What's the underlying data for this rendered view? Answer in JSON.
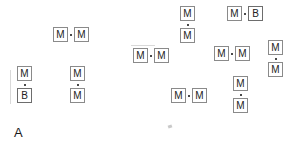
{
  "panel": {
    "label": "A",
    "label_x": 14,
    "label_y": 126
  },
  "canvas": {
    "width": 299,
    "height": 146,
    "background": "#ffffff"
  },
  "style": {
    "box_border_color": "#8a8a8a",
    "box_fill": "#ffffff",
    "text_color": "#222222",
    "bond_color": "#4a4a4a",
    "box_size": 15
  },
  "units": [
    {
      "id": "u1",
      "label": "M",
      "x": 53,
      "y": 27
    },
    {
      "id": "u2",
      "label": "M",
      "x": 74,
      "y": 27
    },
    {
      "id": "u3",
      "label": "M",
      "x": 17,
      "y": 66
    },
    {
      "id": "u4",
      "label": "B",
      "x": 17,
      "y": 88
    },
    {
      "id": "u5",
      "label": "M",
      "x": 70,
      "y": 66
    },
    {
      "id": "u6",
      "label": "M",
      "x": 70,
      "y": 88
    },
    {
      "id": "u7",
      "label": "M",
      "x": 180,
      "y": 6
    },
    {
      "id": "u8",
      "label": "M",
      "x": 180,
      "y": 28
    },
    {
      "id": "u9",
      "label": "M",
      "x": 227,
      "y": 6
    },
    {
      "id": "u10",
      "label": "B",
      "x": 248,
      "y": 6
    },
    {
      "id": "u11",
      "label": "M",
      "x": 133,
      "y": 48
    },
    {
      "id": "u12",
      "label": "M",
      "x": 154,
      "y": 48
    },
    {
      "id": "u13",
      "label": "M",
      "x": 214,
      "y": 46
    },
    {
      "id": "u14",
      "label": "M",
      "x": 235,
      "y": 46
    },
    {
      "id": "u15",
      "label": "M",
      "x": 268,
      "y": 40
    },
    {
      "id": "u16",
      "label": "M",
      "x": 268,
      "y": 62
    },
    {
      "id": "u17",
      "label": "M",
      "x": 171,
      "y": 88
    },
    {
      "id": "u18",
      "label": "M",
      "x": 192,
      "y": 88
    },
    {
      "id": "u19",
      "label": "M",
      "x": 233,
      "y": 76
    },
    {
      "id": "u20",
      "label": "M",
      "x": 233,
      "y": 98
    }
  ],
  "bonds": [
    {
      "id": "b1",
      "orientation": "horizontal",
      "x": 70,
      "y": 34
    },
    {
      "id": "b2",
      "orientation": "vertical",
      "x": 24,
      "y": 84
    },
    {
      "id": "b3",
      "orientation": "vertical",
      "x": 77,
      "y": 84
    },
    {
      "id": "b4",
      "orientation": "vertical",
      "x": 187,
      "y": 24
    },
    {
      "id": "b5",
      "orientation": "horizontal",
      "x": 244,
      "y": 13
    },
    {
      "id": "b6",
      "orientation": "horizontal",
      "x": 150,
      "y": 55
    },
    {
      "id": "b7",
      "orientation": "horizontal",
      "x": 231,
      "y": 53
    },
    {
      "id": "b8",
      "orientation": "vertical",
      "x": 275,
      "y": 58
    },
    {
      "id": "b9",
      "orientation": "horizontal",
      "x": 188,
      "y": 95
    },
    {
      "id": "b10",
      "orientation": "vertical",
      "x": 240,
      "y": 94
    }
  ],
  "artifacts": [
    {
      "id": "a1",
      "kind": "v",
      "x": 10,
      "y": 70,
      "w": 1,
      "h": 34
    },
    {
      "id": "a2",
      "kind": "h",
      "x": 131,
      "y": 45,
      "w": 24,
      "h": 1
    },
    {
      "id": "a3",
      "kind": "speck",
      "x": 168,
      "y": 125
    }
  ]
}
